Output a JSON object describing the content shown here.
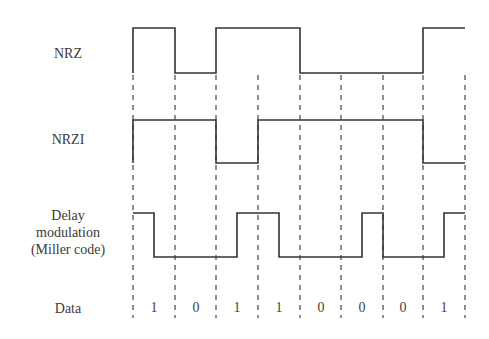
{
  "labels": {
    "nrz": "NRZ",
    "nrzi": "NRZI",
    "miller_line1": "Delay",
    "miller_line2": "modulation",
    "miller_line3": "(Miller code)",
    "data": "Data"
  },
  "data_bits": [
    "1",
    "0",
    "1",
    "1",
    "0",
    "0",
    "0",
    "1"
  ],
  "boundaries_x": [
    133,
    175,
    216,
    258,
    300,
    341,
    383,
    423,
    465
  ],
  "waveforms": {
    "nrz": {
      "high_y": 28,
      "low_y": 73,
      "levels": [
        1,
        0,
        1,
        1,
        0,
        0,
        0,
        1
      ]
    },
    "nrzi": {
      "high_y": 120,
      "low_y": 163,
      "levels": [
        1,
        1,
        0,
        1,
        1,
        1,
        1,
        0
      ]
    },
    "miller": {
      "high_y": 213,
      "low_y": 257,
      "half_levels": [
        1,
        0,
        0,
        0,
        0,
        1,
        1,
        0,
        0,
        0,
        0,
        1,
        0,
        0,
        0,
        1
      ]
    }
  },
  "colors": {
    "line": "#333333",
    "dash": "#444444"
  }
}
